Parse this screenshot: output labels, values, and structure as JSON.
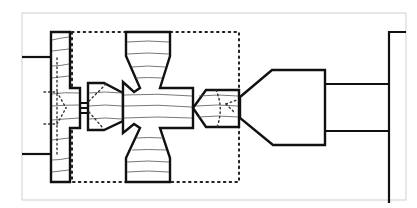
{
  "diagram": {
    "colors": {
      "stroke": "#111111",
      "frame": "#cfcfcf",
      "background": "#ffffff",
      "grain": "#555555"
    },
    "components": [
      {
        "id": "left-rail",
        "label": ""
      },
      {
        "id": "left-connector-lines",
        "label": ""
      },
      {
        "id": "coupling-pins",
        "label": ""
      },
      {
        "id": "left-hex-piece",
        "label": ""
      },
      {
        "id": "central-cross-body",
        "label": ""
      },
      {
        "id": "right-hex-piece",
        "label": ""
      },
      {
        "id": "dotted-boundary",
        "label": ""
      },
      {
        "id": "funnel-housing",
        "label": ""
      },
      {
        "id": "right-rods",
        "label": ""
      },
      {
        "id": "right-plate",
        "label": ""
      }
    ]
  }
}
